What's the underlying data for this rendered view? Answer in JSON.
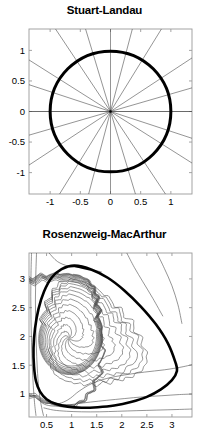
{
  "figure": {
    "background_color": "#ffffff",
    "axis_color": "#9a9a9a",
    "trajectory_color": "#4d4d4d",
    "limit_cycle_color": "#000000",
    "text_color": "#000000"
  },
  "panels": [
    {
      "id": "stuart-landau",
      "title": "Stuart-Landau",
      "chart_data": {
        "type": "line",
        "title": "Stuart-Landau",
        "xlabel": "",
        "ylabel": "",
        "xlim": [
          -1.35,
          1.35
        ],
        "ylim": [
          -1.35,
          1.35
        ],
        "grid": false,
        "legend": "none",
        "x_ticks": [
          -1,
          -0.5,
          0,
          0.5,
          1
        ],
        "x_tick_labels": [
          "-1",
          "-0.5",
          "0",
          "0.5",
          "1"
        ],
        "y_ticks": [
          -1,
          -0.5,
          0,
          0.5,
          1
        ],
        "y_tick_labels": [
          "-1",
          "-0.5",
          "0",
          "0.5",
          "1"
        ],
        "series": [
          {
            "name": "limit-cycle",
            "kind": "circle",
            "center": [
              0,
              0
            ],
            "radius": 1.0,
            "linewidth": 3.0,
            "color": "#000000"
          },
          {
            "name": "trajectory-rays",
            "kind": "radial-lines",
            "count": 11,
            "angles_deg": [
              0,
              16,
              33,
              58,
              75,
              90,
              107,
              124,
              148,
              162,
              180
            ],
            "linewidth": 0.6,
            "color": "#4d4d4d",
            "note": "straight radial trajectories through the origin spiralling out/in to the unit-circle limit cycle"
          }
        ],
        "fixed_point": {
          "x": 0,
          "y": 0,
          "type": "unstable-focus"
        }
      }
    },
    {
      "id": "rosenzweig-macarthur",
      "title": "Rosenzweig-MacArthur",
      "chart_data": {
        "type": "line",
        "title": "Rosenzweig-MacArthur",
        "xlabel": "",
        "ylabel": "",
        "xlim": [
          0.15,
          3.4
        ],
        "ylim": [
          0.6,
          3.45
        ],
        "grid": false,
        "legend": "none",
        "x_ticks": [
          0.5,
          1,
          1.5,
          2,
          2.5,
          3
        ],
        "x_tick_labels": [
          "0.5",
          "1",
          "1.5",
          "2",
          "2.5",
          "3"
        ],
        "y_ticks": [
          1,
          1.5,
          2,
          2.5,
          3
        ],
        "y_tick_labels": [
          "1",
          "1.5",
          "2",
          "2.5",
          "3"
        ],
        "fixed_point": {
          "x": 0.95,
          "y": 1.97,
          "type": "unstable-focus"
        },
        "series": [
          {
            "name": "limit-cycle",
            "kind": "closed-orbit",
            "linewidth": 2.6,
            "color": "#000000",
            "points": [
              [
                1.06,
                3.23
              ],
              [
                1.4,
                3.16
              ],
              [
                1.72,
                3.02
              ],
              [
                2.05,
                2.8
              ],
              [
                2.38,
                2.52
              ],
              [
                2.68,
                2.21
              ],
              [
                2.92,
                1.88
              ],
              [
                3.07,
                1.55
              ],
              [
                3.1,
                1.4
              ],
              [
                3.0,
                1.24
              ],
              [
                2.78,
                1.08
              ],
              [
                2.5,
                0.95
              ],
              [
                2.18,
                0.86
              ],
              [
                1.85,
                0.8
              ],
              [
                1.52,
                0.77
              ],
              [
                1.2,
                0.76
              ],
              [
                0.92,
                0.78
              ],
              [
                0.68,
                0.83
              ],
              [
                0.5,
                0.91
              ],
              [
                0.37,
                1.04
              ],
              [
                0.29,
                1.22
              ],
              [
                0.25,
                1.48
              ],
              [
                0.24,
                1.8
              ],
              [
                0.27,
                2.14
              ],
              [
                0.34,
                2.48
              ],
              [
                0.45,
                2.78
              ],
              [
                0.6,
                3.02
              ],
              [
                0.8,
                3.17
              ],
              [
                1.06,
                3.23
              ]
            ]
          },
          {
            "name": "inward-spirals",
            "kind": "spiral-family",
            "count": 9,
            "linewidth": 0.6,
            "color": "#4d4d4d",
            "note": "trajectories spiralling outward from near the unstable focus toward the limit cycle"
          },
          {
            "name": "outer-approach-curves",
            "kind": "open-trajectories",
            "count": 3,
            "linewidth": 0.6,
            "color": "#4d4d4d",
            "note": "trajectories entering from the right boundary and converging onto the limit cycle"
          }
        ]
      }
    }
  ]
}
